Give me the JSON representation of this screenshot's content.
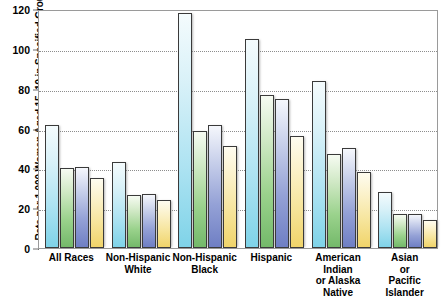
{
  "chart_data": {
    "type": "bar",
    "title": "",
    "xlabel": "",
    "ylabel": "Rate per 1,000 Women Aged 15–19 in Specified Group",
    "ylim": [
      0,
      120
    ],
    "yticks": [
      0,
      20,
      40,
      60,
      80,
      100,
      120
    ],
    "grid": true,
    "legend_position": "none",
    "categories": [
      "All Races",
      "Non-Hispanic White",
      "Non-Hispanic Black",
      "Hispanic",
      "American Indian or Alaska Native",
      "Asian or Pacific Islander"
    ],
    "category_label_lines": [
      [
        "All Races"
      ],
      [
        "Non-Hispanic",
        "White"
      ],
      [
        "Non-Hispanic",
        "Black"
      ],
      [
        "Hispanic"
      ],
      [
        "American",
        "Indian",
        "or Alaska",
        "Native"
      ],
      [
        "Asian",
        "or",
        "Pacific",
        "Islander"
      ]
    ],
    "series": [
      {
        "name": "Series 1",
        "color": "#9fdcee",
        "values": [
          61.8,
          43.0,
          118.0,
          105.0,
          84.0,
          28.0
        ]
      },
      {
        "name": "Series 2",
        "color": "#8fcb80",
        "values": [
          40.0,
          26.5,
          59.0,
          77.0,
          47.0,
          17.0
        ]
      },
      {
        "name": "Series 3",
        "color": "#8c99d2",
        "values": [
          40.5,
          27.0,
          62.0,
          75.0,
          50.0,
          17.0
        ]
      },
      {
        "name": "Series 4",
        "color": "#f5e19a",
        "values": [
          35.0,
          24.0,
          51.0,
          56.0,
          38.0,
          14.0
        ]
      }
    ]
  },
  "axis": {
    "y_title": "Rate per 1,000 Women Aged 15–19 in Specified Group"
  }
}
